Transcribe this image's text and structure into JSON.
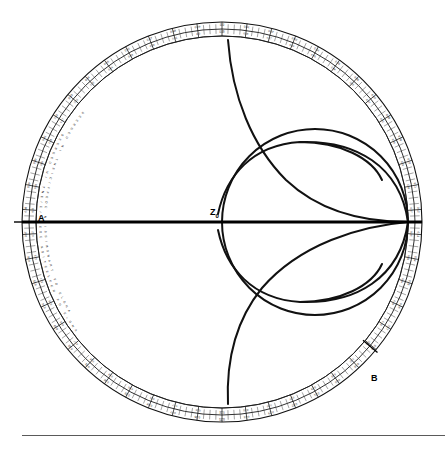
{
  "figure": {
    "kind": "smith-chart",
    "title": "",
    "background_color": "#ffffff",
    "ink_color": "#111111"
  },
  "geometry": {
    "center_x": 222,
    "center_y": 222,
    "outer_radius": 200,
    "rim_band_outer_radius": 200,
    "rim_band_mid_radius": 193,
    "rim_band_inner_radius": 186,
    "chart_radius": 186
  },
  "annotations": {
    "center_label": "Z",
    "center_label_subscript": "0",
    "point_a": "A",
    "point_b": "B"
  },
  "rim_words": [
    "ANGLE OF REFLECTION COEFFICIENT IN DEGREES",
    "ANGLE OF TRANSMISSION COEFFICIENT IN DEGREES"
  ],
  "rim_scale_outer": {
    "name": "WAVELENGTHS TOWARD GENERATOR",
    "start_value": 0.0,
    "end_value": 0.5,
    "step": 0.01,
    "labeled_step": 0.02,
    "labels": [
      "0.0",
      "0.01",
      "0.02",
      "0.03",
      "0.04",
      "0.05",
      "0.06",
      "0.07",
      "0.08",
      "0.09",
      "0.10",
      "0.11",
      "0.12",
      "0.13",
      "0.14",
      "0.15",
      "0.16",
      "0.17",
      "0.18",
      "0.19",
      "0.20",
      "0.21",
      "0.22",
      "0.23",
      "0.24",
      "0.25",
      "0.26",
      "0.27",
      "0.28",
      "0.29",
      "0.30",
      "0.31",
      "0.32",
      "0.33",
      "0.34",
      "0.35",
      "0.36",
      "0.37",
      "0.38",
      "0.39",
      "0.40",
      "0.41",
      "0.42",
      "0.43",
      "0.44",
      "0.45",
      "0.46",
      "0.47",
      "0.48",
      "0.49"
    ]
  },
  "rim_scale_inner": {
    "name": "WAVELENGTHS TOWARD LOAD",
    "start_value": 0.0,
    "end_value": 0.5,
    "step": 0.01,
    "labeled_step": 0.02,
    "labels": [
      "0.49",
      "0.48",
      "0.47",
      "0.46",
      "0.45",
      "0.44",
      "0.43",
      "0.42",
      "0.41",
      "0.40",
      "0.39",
      "0.38",
      "0.37",
      "0.36",
      "0.35",
      "0.34",
      "0.33",
      "0.32",
      "0.31",
      "0.30",
      "0.29",
      "0.28",
      "0.27",
      "0.26",
      "0.25",
      "0.24",
      "0.23",
      "0.22",
      "0.21",
      "0.20",
      "0.19",
      "0.18",
      "0.17",
      "0.16",
      "0.15",
      "0.14",
      "0.13",
      "0.12",
      "0.11",
      "0.10",
      "0.09",
      "0.08",
      "0.07",
      "0.06",
      "0.05",
      "0.04",
      "0.03",
      "0.02",
      "0.01",
      "0.0"
    ]
  },
  "chart_data": {
    "type": "line",
    "xlabel": "",
    "ylabel": "",
    "xlim": [
      -1,
      1
    ],
    "ylim": [
      -1,
      1
    ],
    "grid": false,
    "legend": "none",
    "series": [
      {
        "name": "constant-resistance circle r = 1",
        "kind": "circle",
        "normalized_resistance": 1.0,
        "center_u": 0.5,
        "center_v": 0.0,
        "radius_uv": 0.5,
        "pixel_center_x": 315,
        "pixel_center_y": 222,
        "pixel_radius": 93,
        "span": "full"
      },
      {
        "name": "constant-reactance arc x = +1 (upper)",
        "kind": "arc",
        "normalized_reactance": 1.0,
        "center_u": 1.0,
        "center_v": 1.0,
        "radius_uv": 1.0,
        "pixel_center_x": 408,
        "pixel_center_y": 36,
        "pixel_radius": 186,
        "endpoint_right_x": 382,
        "endpoint_right_y": 180
      },
      {
        "name": "constant-reactance arc x = -1 (lower)",
        "kind": "arc",
        "normalized_reactance": -1.0,
        "center_u": 1.0,
        "center_v": -1.0,
        "radius_uv": 1.0,
        "pixel_center_x": 408,
        "pixel_center_y": 408,
        "pixel_radius": 186,
        "endpoint_right_x": 382,
        "endpoint_right_y": 264
      },
      {
        "name": "constant-reactance arc x = +0.5 long sweep (upper-left)",
        "kind": "arc",
        "normalized_reactance": 0.5,
        "center_u": 1.0,
        "center_v": 2.0,
        "radius_uv": 2.0,
        "pixel_start_x": 228,
        "pixel_start_y": 40,
        "pixel_end_x": 400,
        "pixel_end_y": 222
      },
      {
        "name": "constant-reactance arc x = -0.5 long sweep (lower-left)",
        "kind": "arc",
        "normalized_reactance": -0.5,
        "center_u": 1.0,
        "center_v": -2.0,
        "radius_uv": 2.0,
        "pixel_start_x": 228,
        "pixel_start_y": 404,
        "pixel_end_x": 400,
        "pixel_end_y": 222
      },
      {
        "name": "real axis (resistance line)",
        "kind": "line",
        "from_u": -1.0,
        "to_u": 1.0,
        "v": 0.0,
        "pixel_x1": 22,
        "pixel_y1": 222,
        "pixel_x2": 422,
        "pixel_y2": 222
      }
    ],
    "marked_points": [
      {
        "label": "A",
        "description": "short-circuit end of real axis",
        "u": -1.0,
        "v": 0.0,
        "pixel_x": 38,
        "pixel_y": 218
      },
      {
        "label": "Z0",
        "description": "chart centre, normalized reference impedance",
        "u": 0.0,
        "v": 0.0,
        "pixel_x": 215,
        "pixel_y": 214
      },
      {
        "label": "B",
        "description": "rim marker, lower right",
        "angle_deg": -40,
        "pixel_x": 372,
        "pixel_y": 378
      }
    ]
  },
  "footer": {
    "rule_visible": true
  }
}
